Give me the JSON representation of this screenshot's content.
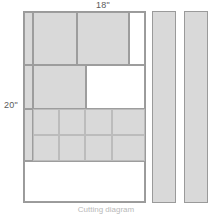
{
  "diagram": {
    "type": "cutting-diagram",
    "caption": "Cutting diagram",
    "dimensions": {
      "width_label": "18\"",
      "height_label": "20\""
    },
    "colors": {
      "piece_fill": "#d9d9d9",
      "empty_fill": "#ffffff",
      "outline": "#9a9a9a",
      "inner_outline": "#9d9d9d",
      "label_text": "#5a5a5a",
      "caption_text": "#b9b9b9",
      "background": "#ffffff"
    },
    "main_panel": {
      "name": "main fabric panel",
      "bands": [
        {
          "name": "top band",
          "pieces": [
            {
              "name": "left narrow strip",
              "fill": "gray",
              "x": 0,
              "y": 0,
              "w": 9,
              "h": 53
            },
            {
              "name": "upper large block left",
              "fill": "gray",
              "x": 9,
              "y": 0,
              "w": 44,
              "h": 53
            },
            {
              "name": "upper large block right",
              "fill": "gray",
              "x": 53,
              "y": 0,
              "w": 52,
              "h": 53
            },
            {
              "name": "upper right margin",
              "fill": "white",
              "x": 105,
              "y": 0,
              "w": 16,
              "h": 53
            }
          ]
        },
        {
          "name": "middle band",
          "pieces": [
            {
              "name": "middle left narrow strip",
              "fill": "gray",
              "x": 0,
              "y": 53,
              "w": 9,
              "h": 44
            },
            {
              "name": "middle gray block",
              "fill": "gray",
              "x": 9,
              "y": 53,
              "w": 53,
              "h": 44
            },
            {
              "name": "middle white block",
              "fill": "white",
              "x": 62,
              "y": 53,
              "w": 59,
              "h": 44
            }
          ]
        },
        {
          "name": "grid band",
          "grid": {
            "rows": 2,
            "cols": 4,
            "left_strip": {
              "name": "grid left narrow strip",
              "fill": "gray",
              "x": 0,
              "y": 97,
              "w": 9,
              "h": 52
            },
            "cells": [
              {
                "name": "grid cell r1c1",
                "fill": "gray",
                "x": 9,
                "y": 97,
                "w": 26,
                "h": 26
              },
              {
                "name": "grid cell r1c2",
                "fill": "gray",
                "x": 35,
                "y": 97,
                "w": 26,
                "h": 26
              },
              {
                "name": "grid cell r1c3",
                "fill": "gray",
                "x": 61,
                "y": 97,
                "w": 27,
                "h": 26
              },
              {
                "name": "grid cell r1c4",
                "fill": "gray",
                "x": 88,
                "y": 97,
                "w": 33,
                "h": 26
              },
              {
                "name": "grid cell r2c1",
                "fill": "gray",
                "x": 9,
                "y": 123,
                "w": 26,
                "h": 26
              },
              {
                "name": "grid cell r2c2",
                "fill": "gray",
                "x": 35,
                "y": 123,
                "w": 26,
                "h": 26
              },
              {
                "name": "grid cell r2c3",
                "fill": "gray",
                "x": 61,
                "y": 123,
                "w": 27,
                "h": 26
              },
              {
                "name": "grid cell r2c4",
                "fill": "gray",
                "x": 88,
                "y": 123,
                "w": 33,
                "h": 26
              }
            ]
          }
        },
        {
          "name": "bottom band",
          "pieces": [
            {
              "name": "bottom empty area",
              "fill": "white",
              "x": 0,
              "y": 149,
              "w": 121,
              "h": 41
            }
          ]
        }
      ]
    },
    "side_strips": [
      {
        "name": "side strip 1",
        "fill": "gray"
      },
      {
        "name": "side strip 2",
        "fill": "gray"
      }
    ]
  }
}
